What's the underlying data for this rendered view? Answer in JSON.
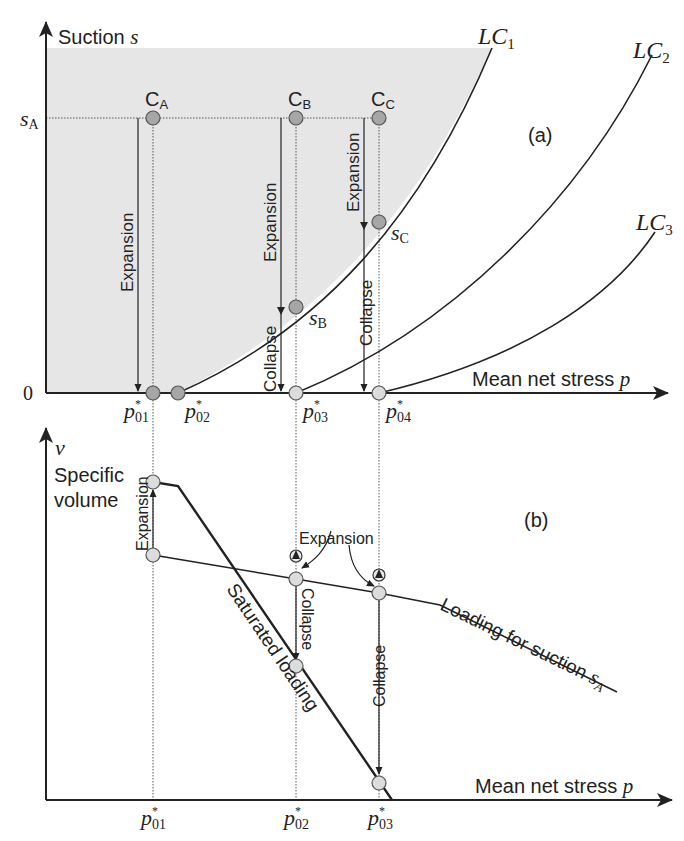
{
  "figure": {
    "panel_a": {
      "label": "(a)",
      "y_axis_label": "Suction ",
      "y_axis_symbol": "s",
      "x_axis_label": "Mean net stress ",
      "x_axis_symbol": "p",
      "origin_label": "0",
      "sA_label": "s",
      "sA_sub": "A",
      "points": [
        {
          "id": "CA",
          "main": "C",
          "sub": "A"
        },
        {
          "id": "CB",
          "main": "C",
          "sub": "B"
        },
        {
          "id": "CC",
          "main": "C",
          "sub": "C"
        }
      ],
      "yield_points": [
        {
          "id": "sB",
          "main": "s",
          "sub": "B"
        },
        {
          "id": "sC",
          "main": "s",
          "sub": "C"
        }
      ],
      "curves": [
        {
          "main": "LC",
          "sub": "1"
        },
        {
          "main": "LC",
          "sub": "2"
        },
        {
          "main": "LC",
          "sub": "3"
        }
      ],
      "x_ticks": [
        {
          "main": "p",
          "sup": "*",
          "sub": "01"
        },
        {
          "main": "p",
          "sup": "*",
          "sub": "02"
        },
        {
          "main": "p",
          "sup": "*",
          "sub": "03"
        },
        {
          "main": "p",
          "sup": "*",
          "sub": "04"
        }
      ],
      "annotations": {
        "expansion_a": "Expansion",
        "expansion_b": "Expansion",
        "expansion_c": "Expansion",
        "collapse_b": "Collapse",
        "collapse_c": "Collapse"
      }
    },
    "panel_b": {
      "label": "(b)",
      "y_axis_symbol": "v",
      "y_axis_label_line1": "Specific",
      "y_axis_label_line2": "volume",
      "x_axis_label": "Mean net stress ",
      "x_axis_symbol": "p",
      "x_ticks": [
        {
          "main": "p",
          "sup": "*",
          "sub": "01"
        },
        {
          "main": "p",
          "sup": "*",
          "sub": "02"
        },
        {
          "main": "p",
          "sup": "*",
          "sub": "03"
        }
      ],
      "annotations": {
        "expansion_left": "Expansion",
        "expansion_middle": "Expansion",
        "collapse_b": "Collapse",
        "collapse_c": "Collapse",
        "saturated_loading": "Saturated loading",
        "loading_suction": "Loading for suction ",
        "loading_suction_symbol": "s",
        "loading_suction_sub": "A"
      }
    },
    "colors": {
      "shaded_region": "#e6e6e6",
      "point_dark": "#a6a6a6",
      "point_light": "#dcdcdc",
      "line": "#222222"
    }
  }
}
